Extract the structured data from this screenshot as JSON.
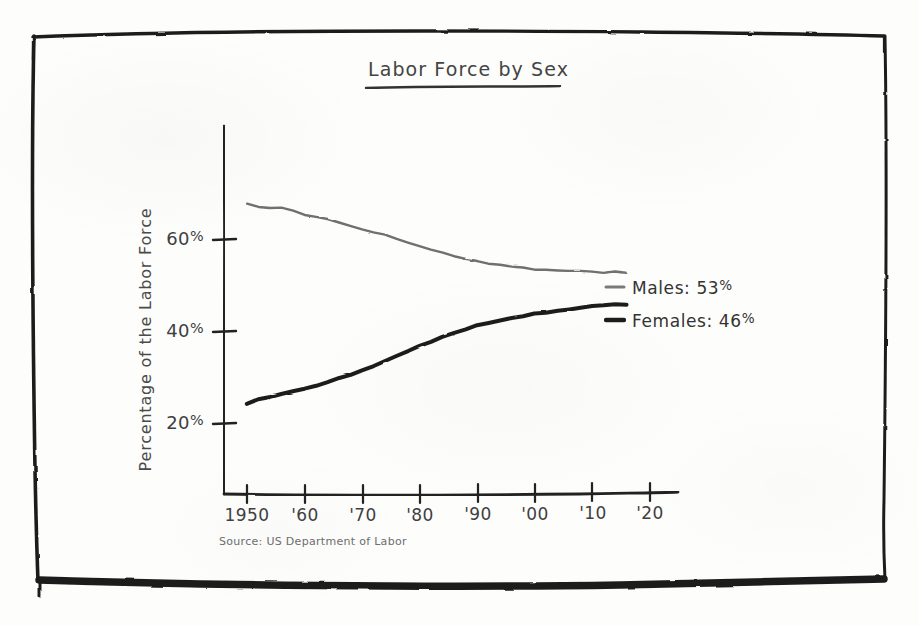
{
  "page": {
    "background_color": "#fdfdfc",
    "ink_color": "#2b2b2b",
    "style": "hand-drawn sketch on paper"
  },
  "frame": {
    "name": "hand-drawn-border",
    "color": "#1f1f1f"
  },
  "chart_data": {
    "type": "line",
    "title": "Labor Force by Sex",
    "xlabel": "",
    "ylabel": "Percentage of the Labor Force",
    "source": "Source: US Department of Labor",
    "grid": false,
    "legend_position": "right-inline",
    "xlim": [
      1950,
      2020
    ],
    "ylim": [
      10,
      75
    ],
    "x_tick_labels": [
      "1950",
      "'60",
      "'70",
      "'80",
      "'90",
      "'00",
      "'10",
      "'20"
    ],
    "x_tick_values": [
      1950,
      1960,
      1970,
      1980,
      1990,
      2000,
      2010,
      2020
    ],
    "y_tick_labels": [
      "20%",
      "40%",
      "60%"
    ],
    "y_tick_values": [
      20,
      40,
      60
    ],
    "series": [
      {
        "name": "Males",
        "label": "Males: 53%",
        "end_value_label": "53%",
        "color": "#6f6f6f",
        "stroke_width": 2.4,
        "x": [
          1950,
          1952,
          1954,
          1956,
          1958,
          1960,
          1962,
          1964,
          1966,
          1968,
          1970,
          1972,
          1974,
          1976,
          1978,
          1980,
          1982,
          1984,
          1986,
          1988,
          1990,
          1992,
          1994,
          1996,
          1998,
          2000,
          2002,
          2004,
          2006,
          2008,
          2010,
          2012,
          2014,
          2016
        ],
        "values": [
          68.0,
          67.2,
          66.8,
          66.9,
          66.3,
          65.6,
          65.0,
          64.4,
          63.8,
          63.1,
          62.4,
          61.7,
          61.0,
          60.2,
          59.4,
          58.6,
          57.9,
          57.2,
          56.6,
          56.0,
          55.4,
          55.0,
          54.6,
          54.3,
          54.0,
          53.7,
          53.5,
          53.4,
          53.3,
          53.2,
          53.1,
          53.0,
          53.0,
          53.0
        ]
      },
      {
        "name": "Females",
        "label": "Females: 46%",
        "end_value_label": "46%",
        "color": "#1f1f1f",
        "stroke_width": 4.0,
        "x": [
          1950,
          1952,
          1954,
          1956,
          1958,
          1960,
          1962,
          1964,
          1966,
          1968,
          1970,
          1972,
          1974,
          1976,
          1978,
          1980,
          1982,
          1984,
          1986,
          1988,
          1990,
          1992,
          1994,
          1996,
          1998,
          2000,
          2002,
          2004,
          2006,
          2008,
          2010,
          2012,
          2014,
          2016
        ],
        "values": [
          24.5,
          25.3,
          25.8,
          26.4,
          27.0,
          27.7,
          28.4,
          29.1,
          29.9,
          30.7,
          31.6,
          32.6,
          33.6,
          34.7,
          35.9,
          37.0,
          38.0,
          39.0,
          39.9,
          40.7,
          41.4,
          42.0,
          42.6,
          43.1,
          43.5,
          43.9,
          44.3,
          44.7,
          45.0,
          45.3,
          45.6,
          45.8,
          46.0,
          46.0
        ]
      }
    ]
  },
  "legend": {
    "items": [
      {
        "name": "males",
        "label": "Males: 53%",
        "swatch_color": "#6f6f6f"
      },
      {
        "name": "females",
        "label": "Females: 46%",
        "swatch_color": "#1f1f1f"
      }
    ]
  }
}
